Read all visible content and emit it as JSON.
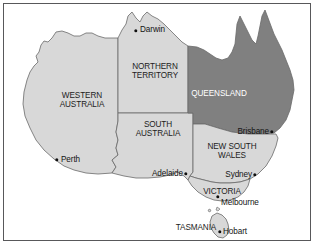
{
  "figure": {
    "background_color": "#ffffff",
    "border_color": "#58585a"
  },
  "palette": {
    "land_light": "#d8d8d8",
    "land_dark": "#808080",
    "outline": "#6a6a6a",
    "border_line": "#707070",
    "text_dark": "#1c1c1c",
    "text_light": "#ffffff",
    "dot": "#101010"
  },
  "states": [
    {
      "id": "western-australia",
      "name": "WESTERN\nAUSTRALIA",
      "line1": "WESTERN",
      "line2": "AUSTRALIA",
      "shade": "light",
      "label_x": 82,
      "label_y": 92
    },
    {
      "id": "northern-territory",
      "name": "NORTHERN\nTERRITORY",
      "line1": "NORTHERN",
      "line2": "TERRITORY",
      "shade": "light",
      "label_x": 155,
      "label_y": 63
    },
    {
      "id": "queensland",
      "name": "QUEENSLAND",
      "line1": "QUEENSLAND",
      "line2": "",
      "shade": "dark",
      "label_x": 219,
      "label_y": 90
    },
    {
      "id": "south-australia",
      "name": "SOUTH\nAUSTRALIA",
      "line1": "SOUTH",
      "line2": "AUSTRALIA",
      "shade": "light",
      "label_x": 158,
      "label_y": 121
    },
    {
      "id": "new-south-wales",
      "name": "NEW SOUTH\nWALES",
      "line1": "NEW SOUTH",
      "line2": "WALES",
      "shade": "light",
      "label_x": 232,
      "label_y": 143
    },
    {
      "id": "victoria",
      "name": "VICTORIA",
      "line1": "VICTORIA",
      "line2": "",
      "shade": "light",
      "label_x": 222,
      "label_y": 188
    },
    {
      "id": "tasmania",
      "name": "TASMANIA",
      "line1": "TASMANIA",
      "line2": "",
      "shade": "light",
      "label_x": 196,
      "label_y": 224
    }
  ],
  "cities": [
    {
      "id": "darwin",
      "name": "Darwin",
      "dot_x": 136,
      "dot_y": 31,
      "label_x": 140,
      "label_y": 30,
      "side": "left"
    },
    {
      "id": "perth",
      "name": "Perth",
      "dot_x": 57,
      "dot_y": 160,
      "label_x": 61,
      "label_y": 160,
      "side": "left"
    },
    {
      "id": "brisbane",
      "name": "Brisbane",
      "dot_x": 272,
      "dot_y": 132,
      "label_x": 269,
      "label_y": 132,
      "side": "right"
    },
    {
      "id": "adelaide",
      "name": "Adelaide",
      "dot_x": 186,
      "dot_y": 174,
      "label_x": 183,
      "label_y": 174,
      "side": "right"
    },
    {
      "id": "sydney",
      "name": "Sydney",
      "dot_x": 255,
      "dot_y": 175,
      "label_x": 252,
      "label_y": 175,
      "side": "right"
    },
    {
      "id": "melbourne",
      "name": "Melbourne",
      "dot_x": 218,
      "dot_y": 197,
      "label_x": 221,
      "label_y": 203,
      "side": "left"
    },
    {
      "id": "hobart",
      "name": "Hobart",
      "dot_x": 220,
      "dot_y": 232,
      "label_x": 223,
      "label_y": 232,
      "side": "left"
    }
  ]
}
